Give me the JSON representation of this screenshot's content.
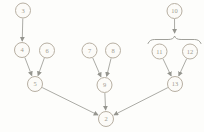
{
  "figure": {
    "size": {
      "width": 204,
      "height": 132
    },
    "background": "#fdfdfb",
    "node_radius": 7.5,
    "node_fill": "#fcfbf8",
    "node_stroke": "#b7afa2",
    "label_color": "#a19b90",
    "edge_color": "#95958f",
    "nodes": [
      {
        "id": "3",
        "x": 23,
        "y": 10.5
      },
      {
        "id": "4",
        "x": 22,
        "y": 50
      },
      {
        "id": "6",
        "x": 47,
        "y": 50.5
      },
      {
        "id": "7",
        "x": 89.5,
        "y": 50.5
      },
      {
        "id": "8",
        "x": 113,
        "y": 50.5
      },
      {
        "id": "10",
        "x": 174.5,
        "y": 11
      },
      {
        "id": "11",
        "x": 159.5,
        "y": 51.5
      },
      {
        "id": "12",
        "x": 190,
        "y": 51.5
      },
      {
        "id": "5",
        "x": 35,
        "y": 84
      },
      {
        "id": "9",
        "x": 104.5,
        "y": 85
      },
      {
        "id": "13",
        "x": 175,
        "y": 84
      },
      {
        "id": "2",
        "x": 106,
        "y": 119
      }
    ],
    "edges": [
      {
        "from": "3",
        "to": "4"
      },
      {
        "from": "4",
        "to": "5"
      },
      {
        "from": "6",
        "to": "5"
      },
      {
        "from": "7",
        "to": "9"
      },
      {
        "from": "8",
        "to": "9"
      },
      {
        "from": "11",
        "to": "13"
      },
      {
        "from": "12",
        "to": "13"
      },
      {
        "from": "5",
        "to": "2"
      },
      {
        "from": "9",
        "to": "2"
      },
      {
        "from": "13",
        "to": "2"
      },
      {
        "from": "10",
        "to_point": [
          174.6,
          33.5
        ]
      }
    ],
    "brace": {
      "x_left": 148,
      "x_right": 201,
      "y_base": 43.5,
      "y_arm": 39.5,
      "peak_x": 174.6,
      "peak_y": 36
    }
  }
}
